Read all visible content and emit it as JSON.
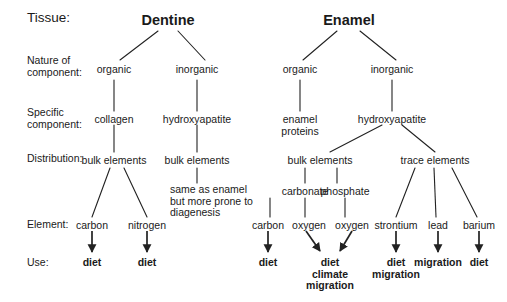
{
  "figure": {
    "type": "hierarchy-diagram",
    "background_color": "#ffffff",
    "text_color": "#1a1a1a",
    "line_color": "#222222"
  },
  "row_labels": {
    "tissue": "Tissue:",
    "nature": "Nature of\ncomponent:",
    "specific": "Specific\ncomponent:",
    "distribution": "Distribution:",
    "element": "Element:",
    "use": "Use:"
  },
  "titles": {
    "dentine": "Dentine",
    "enamel": "Enamel"
  },
  "dentine": {
    "nature": {
      "organic": "organic",
      "inorganic": "inorganic"
    },
    "specific": {
      "collagen": "collagen",
      "hydroxyapatite": "hydroxyapatite"
    },
    "distribution": {
      "bulk_organic": "bulk elements",
      "bulk_inorganic": "bulk elements"
    },
    "note": "same as enamel\nbut more prone to\ndiagenesis",
    "elements": {
      "carbon": "carbon",
      "nitrogen": "nitrogen"
    },
    "uses": {
      "carbon": "diet",
      "nitrogen": "diet"
    }
  },
  "enamel": {
    "nature": {
      "organic": "organic",
      "inorganic": "inorganic"
    },
    "specific": {
      "enamel_proteins": "enamel\nproteins",
      "hydroxyapatite": "hydroxyapatite"
    },
    "distribution": {
      "bulk": "bulk elements",
      "trace": "trace elements"
    },
    "compounds": {
      "carbonate": "carbonate",
      "phosphate": "phosphate"
    },
    "elements": {
      "carbon": "carbon",
      "oxygen_carbonate": "oxygen",
      "oxygen_phosphate": "oxygen",
      "strontium": "strontium",
      "lead": "lead",
      "barium": "barium"
    },
    "uses": {
      "carbon": "diet",
      "oxygen_shared": "diet\nclimate\nmigration",
      "strontium": "diet\nmigration",
      "lead": "migration",
      "barium": "diet"
    }
  }
}
